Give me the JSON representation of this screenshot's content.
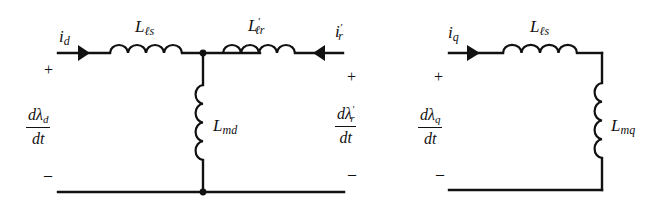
{
  "diagram": {
    "type": "equivalent-circuit",
    "d_axis": {
      "current_left": {
        "symbol": "i",
        "sub": "d",
        "prime": ""
      },
      "current_right": {
        "symbol": "i",
        "sub": "r",
        "prime": "′"
      },
      "series_left": {
        "symbol": "L",
        "sub": "ℓs",
        "prime": ""
      },
      "series_right": {
        "symbol": "L",
        "sub": "ℓr",
        "prime": "′"
      },
      "magnetizing": {
        "symbol": "L",
        "sub": "md",
        "prime": ""
      },
      "voltage_left": {
        "num_prefix": "dλ",
        "num_sub": "d",
        "num_prime": "",
        "den": "dt"
      },
      "voltage_right": {
        "num_prefix": "dλ",
        "num_sub": "r",
        "num_prime": "′",
        "den": "dt"
      },
      "plus": "+",
      "minus": "–"
    },
    "q_axis": {
      "current": {
        "symbol": "i",
        "sub": "q",
        "prime": ""
      },
      "series": {
        "symbol": "L",
        "sub": "ℓs",
        "prime": ""
      },
      "magnetizing": {
        "symbol": "L",
        "sub": "mq",
        "prime": ""
      },
      "voltage": {
        "num_prefix": "dλ",
        "num_sub": "q",
        "num_prime": "",
        "den": "dt"
      },
      "plus": "+",
      "minus": "–"
    },
    "colors": {
      "line": "#111111",
      "background": "#ffffff"
    }
  }
}
